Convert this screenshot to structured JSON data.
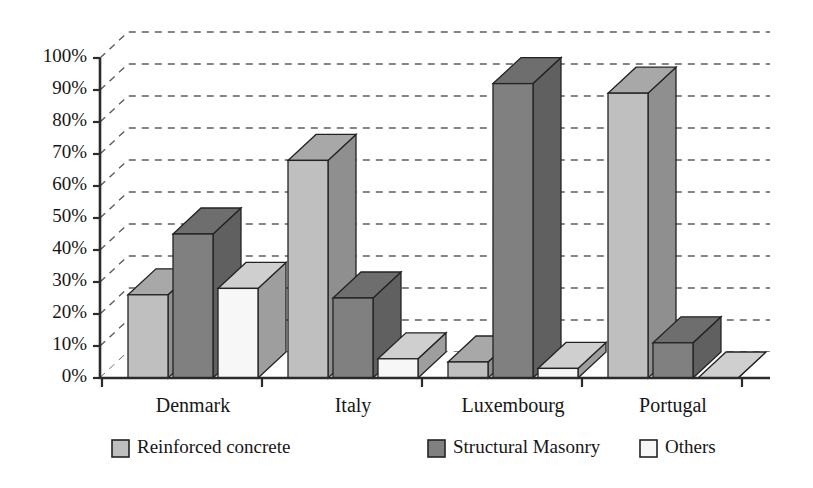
{
  "chart_data": {
    "type": "bar",
    "title": "",
    "subtitle": "",
    "xlabel": "",
    "ylabel": "",
    "categories": [
      "Denmark",
      "Italy",
      "Luxembourg",
      "Portugal"
    ],
    "series": [
      {
        "name": "Reinforced concrete",
        "color": "#bfbfbf",
        "values": [
          26,
          68,
          5,
          89
        ]
      },
      {
        "name": "Structural Masonry",
        "color": "#808080",
        "values": [
          45,
          25,
          92,
          11
        ]
      },
      {
        "name": "Others",
        "color": "#f7f7f7",
        "values": [
          28,
          6,
          3,
          0
        ]
      }
    ],
    "ylim": [
      0,
      100
    ],
    "ytick_values": [
      0,
      10,
      20,
      30,
      40,
      50,
      60,
      70,
      80,
      90,
      100
    ],
    "ytick_labels": [
      "0%",
      "10%",
      "20%",
      "30%",
      "40%",
      "50%",
      "60%",
      "70%",
      "80%",
      "90%",
      "100%"
    ],
    "grid": true,
    "grid_axis": "y",
    "grid_style": "dashed",
    "legend_position": "bottom",
    "three_d": true,
    "value_format": "percent"
  },
  "legend": {
    "items": [
      {
        "label": "Reinforced concrete",
        "swatch_color": "#bfbfbf"
      },
      {
        "label": "Structural Masonry",
        "swatch_color": "#808080"
      },
      {
        "label": "Others",
        "swatch_color": "#f7f7f7"
      }
    ]
  },
  "axes": {
    "y": {
      "ticks": [
        "0%",
        "10%",
        "20%",
        "30%",
        "40%",
        "50%",
        "60%",
        "70%",
        "80%",
        "90%",
        "100%"
      ]
    },
    "x": {
      "ticks": [
        "Denmark",
        "Italy",
        "Luxembourg",
        "Portugal"
      ]
    }
  },
  "palette": {
    "light_gray": "#bfbfbf",
    "dark_gray": "#808080",
    "white_fill": "#f7f7f7",
    "top_light": "#a8a8a8",
    "top_dark": "#6e6e6e",
    "top_white": "#cfcfcf",
    "side_light": "#8f8f8f",
    "side_dark": "#606060",
    "side_white": "#9e9e9e",
    "outline": "#232323",
    "grid": "#5d5d5d",
    "axis": "#2b2b2b",
    "background": "#ffffff"
  }
}
